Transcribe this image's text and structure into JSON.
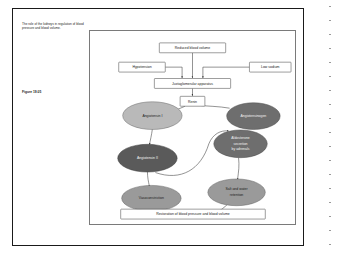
{
  "page": {
    "caption": "The role of the kidneys in regulation of blood pressure and blood volume.",
    "figure_number": "Figure 19.05"
  },
  "colors": {
    "page_border": "#1a1a1a",
    "panel_border": "#7a7a7a",
    "connector": "#3a3a3a",
    "box_fill": "#ffffff",
    "ellipse_light": "#b9b9b9",
    "ellipse_mid": "#9a9a9a",
    "ellipse_dark": "#6e6e6e",
    "ellipse_darkest": "#5a5a5a",
    "text_dark": "#1c1c1c",
    "text_light": "#f2f2f2"
  },
  "diagram": {
    "boxes": [
      {
        "id": "reduced-blood-volume",
        "label": "Reduced blood volume"
      },
      {
        "id": "hypotension",
        "label": "Hypotension"
      },
      {
        "id": "low-sodium",
        "label": "Low sodium"
      },
      {
        "id": "juxtaglomerular-apparatus",
        "label": "Juxtaglomerular apparatus"
      },
      {
        "id": "renin",
        "label": "Renin"
      },
      {
        "id": "restoration",
        "label": "Restoration of blood pressure and blood volume"
      }
    ],
    "ellipses": [
      {
        "id": "angiotensin-i",
        "label": "Angiotensin I",
        "shade": "light"
      },
      {
        "id": "angiotensinogen",
        "label": "Angiotensinogen",
        "shade": "dark"
      },
      {
        "id": "angiotensin-ii",
        "label": "Angiotensin II",
        "shade": "darkest"
      },
      {
        "id": "aldosterone-secretion",
        "label_line1": "Aldosterone",
        "label_line2": "secretion",
        "label_line3": "by adrenals",
        "shade": "dark"
      },
      {
        "id": "vasoconstriction",
        "label": "Vasoconstriction",
        "shade": "mid"
      },
      {
        "id": "salt-water-retention",
        "label_line1": "Salt and water",
        "label_line2": "retention",
        "shade": "mid"
      }
    ]
  }
}
